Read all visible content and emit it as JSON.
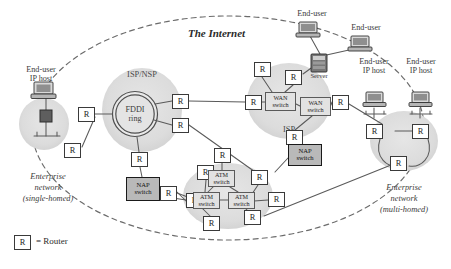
{
  "diagram": {
    "title": "The Internet",
    "legend": {
      "symbol": "R",
      "text": "= Router"
    }
  },
  "clouds": [
    {
      "name": "isp-nsp-cloud",
      "label": "ISP/NSP",
      "cx": 142,
      "cy": 110,
      "rx": 40,
      "ry": 42
    },
    {
      "name": "isp-cloud",
      "label": "ISP",
      "cx": 289,
      "cy": 101,
      "rx": 42,
      "ry": 38
    },
    {
      "name": "nsp-cloud",
      "label": "NSP",
      "cx": 228,
      "cy": 196,
      "rx": 45,
      "ry": 33
    },
    {
      "name": "enterprise-left-cloud",
      "label": "",
      "cx": 44,
      "cy": 124,
      "rx": 25,
      "ry": 26
    },
    {
      "name": "enterprise-right-cloud",
      "label": "",
      "cx": 404,
      "cy": 141,
      "rx": 34,
      "ry": 30
    }
  ],
  "fddi": {
    "label_line1": "FDDI",
    "label_line2": "ring",
    "cx": 135,
    "cy": 114,
    "r": 22
  },
  "routers": [
    {
      "id": "r-ent-left",
      "x": 64,
      "y": 143
    },
    {
      "id": "r-fddi-west",
      "x": 95,
      "y": 107
    },
    {
      "id": "r-fddi-ne",
      "x": 172,
      "y": 94
    },
    {
      "id": "r-fddi-e",
      "x": 172,
      "y": 118
    },
    {
      "id": "r-fddi-south",
      "x": 131,
      "y": 152
    },
    {
      "id": "r-isp-west",
      "x": 245,
      "y": 95
    },
    {
      "id": "r-isp-nw",
      "x": 254,
      "y": 62
    },
    {
      "id": "r-isp-n",
      "x": 289,
      "y": 70
    },
    {
      "id": "r-isp-east",
      "x": 332,
      "y": 95
    },
    {
      "id": "r-isp-south",
      "x": 289,
      "y": 130
    },
    {
      "id": "r-nap-left-e",
      "x": 186,
      "y": 196
    },
    {
      "id": "r-nsp-w",
      "x": 160,
      "y": 186
    },
    {
      "id": "r-nsp-nw",
      "x": 196,
      "y": 165
    },
    {
      "id": "r-nsp-n",
      "x": 216,
      "y": 148
    },
    {
      "id": "r-nsp-ne",
      "x": 258,
      "y": 170
    },
    {
      "id": "r-nsp-e",
      "x": 268,
      "y": 196
    },
    {
      "id": "r-nsp-s",
      "x": 206,
      "y": 216
    },
    {
      "id": "r-nsp-se",
      "x": 247,
      "y": 213
    },
    {
      "id": "r-ent-right-nw",
      "x": 378,
      "y": 124
    },
    {
      "id": "r-ent-right-ne",
      "x": 420,
      "y": 124
    },
    {
      "id": "r-ent-right-s",
      "x": 396,
      "y": 160
    }
  ],
  "switches": [
    {
      "id": "wan-switch-1",
      "line1": "WAN",
      "line2": "switch",
      "x": 265,
      "y": 92,
      "w": 31,
      "h": 19
    },
    {
      "id": "wan-switch-2",
      "line1": "WAN",
      "line2": "switch",
      "x": 300,
      "y": 97,
      "w": 31,
      "h": 19
    },
    {
      "id": "atm-switch-1",
      "line1": "ATM",
      "line2": "switch",
      "x": 208,
      "y": 170,
      "w": 27,
      "h": 17
    },
    {
      "id": "atm-switch-2",
      "line1": "ATM",
      "line2": "switch",
      "x": 193,
      "y": 192,
      "w": 27,
      "h": 17
    },
    {
      "id": "atm-switch-3",
      "line1": "ATM",
      "line2": "switch",
      "x": 228,
      "y": 192,
      "w": 27,
      "h": 17
    }
  ],
  "nap_switches": [
    {
      "id": "nap-switch-left",
      "line1": "NAP",
      "line2": "switch",
      "x": 126,
      "y": 177,
      "w": 34,
      "h": 24
    },
    {
      "id": "nap-switch-right",
      "line1": "NAP",
      "line2": "switch",
      "x": 288,
      "y": 144,
      "w": 34,
      "h": 22
    }
  ],
  "labels": [
    {
      "id": "end-user-ip-host-left",
      "text_line1": "End-user",
      "text_line2": "IP host",
      "x": 12,
      "y": 66,
      "w": 58,
      "style": "plain"
    },
    {
      "id": "end-user-top-1",
      "text_line1": "End-user",
      "text_line2": "",
      "x": 286,
      "y": 8,
      "w": 52,
      "style": "plain"
    },
    {
      "id": "end-user-top-2",
      "text_line1": "End-user",
      "text_line2": "",
      "x": 340,
      "y": 22,
      "w": 52,
      "style": "plain"
    },
    {
      "id": "end-user-ip-host-r1",
      "text_line1": "End-user",
      "text_line2": "IP host",
      "x": 352,
      "y": 73,
      "w": 52,
      "style": "plain"
    },
    {
      "id": "end-user-ip-host-r2",
      "text_line1": "End-user",
      "text_line2": "IP host",
      "x": 400,
      "y": 73,
      "w": 52,
      "style": "plain"
    },
    {
      "id": "server-label",
      "text_line1": "Server",
      "text_line2": "",
      "x": 304,
      "y": 76,
      "w": 40,
      "style": "tiny"
    }
  ],
  "captions": [
    {
      "id": "enterprise-left-caption",
      "lines": [
        "Enterprise",
        "network",
        "(single-homed)"
      ],
      "x": 2,
      "y": 172,
      "w": 92
    },
    {
      "id": "enterprise-right-caption",
      "lines": [
        "Enterprise",
        "network",
        "(multi-homed)"
      ],
      "x": 358,
      "y": 183,
      "w": 92
    }
  ],
  "devices": [
    {
      "id": "host-left",
      "x": 32,
      "y": 82,
      "type": "desktop"
    },
    {
      "id": "host-top-1",
      "x": 297,
      "y": 22,
      "type": "desktop"
    },
    {
      "id": "host-top-2",
      "x": 349,
      "y": 36,
      "type": "desktop"
    },
    {
      "id": "host-right-1",
      "x": 365,
      "y": 92,
      "type": "desktop"
    },
    {
      "id": "host-right-2",
      "x": 411,
      "y": 92,
      "type": "desktop"
    },
    {
      "id": "server-rack",
      "x": 311,
      "y": 54,
      "type": "server"
    }
  ]
}
